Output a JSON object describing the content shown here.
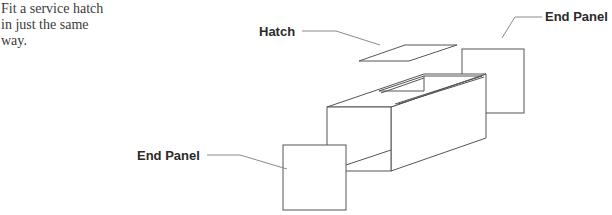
{
  "caption": {
    "lines": [
      "Fit a service hatch",
      "in just the same",
      "way."
    ]
  },
  "diagram": {
    "type": "exploded isometric assembly",
    "labels": {
      "hatch": "Hatch",
      "end_panel_right": "End Panel",
      "end_panel_left": "End Panel"
    },
    "parts": [
      "hatch",
      "box-body",
      "end-panel-right",
      "end-panel-left"
    ],
    "colors": {
      "line": "#555555",
      "leader": "#8a8a8a",
      "text": "#2a2a2a",
      "background": "#ffffff"
    }
  }
}
